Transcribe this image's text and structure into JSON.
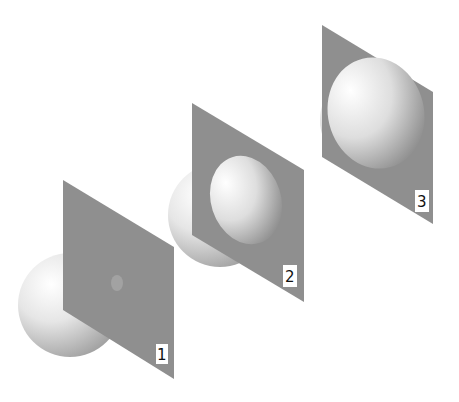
{
  "figure": {
    "colors": {
      "plane": "#8f8f8f",
      "sphere_light": "#ffffff",
      "sphere_dark": "#9a9a9a",
      "label_bg": "#ffffff"
    },
    "stages": [
      {
        "label": "1"
      },
      {
        "label": "2"
      },
      {
        "label": "3"
      }
    ]
  }
}
